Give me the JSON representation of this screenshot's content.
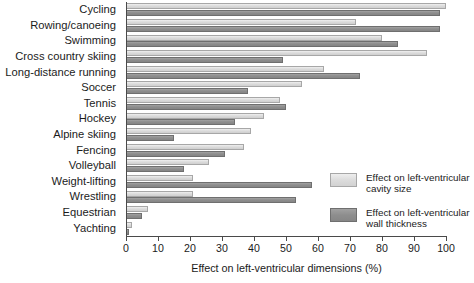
{
  "chart_data": {
    "type": "bar",
    "orientation": "horizontal",
    "title": "",
    "xlabel": "Effect on left-ventricular dimensions (%)",
    "ylabel": "",
    "xlim": [
      0,
      100
    ],
    "xticks": [
      0,
      10,
      20,
      30,
      40,
      50,
      60,
      70,
      80,
      90,
      100
    ],
    "xtick_labels": [
      "0",
      "10",
      "20",
      "30",
      "40",
      "50",
      "60",
      "70",
      "80",
      "90",
      "100"
    ],
    "grid": false,
    "legend_position": "right-lower",
    "categories": [
      "Cycling",
      "Rowing/canoeing",
      "Swimming",
      "Cross country skiing",
      "Long-distance running",
      "Soccer",
      "Tennis",
      "Hockey",
      "Alpine skiing",
      "Fencing",
      "Volleyball",
      "Weight-lifting",
      "Wrestling",
      "Equestrian",
      "Yachting"
    ],
    "series": [
      {
        "name": "Effect on left-ventricular cavity size",
        "color": "#dcdcdc",
        "values": [
          100,
          72,
          80,
          94,
          62,
          55,
          48,
          43,
          39,
          37,
          26,
          21,
          21,
          7,
          2
        ]
      },
      {
        "name": "Effect on left-ventricular wall thickness",
        "color": "#8e8e8e",
        "values": [
          98,
          98,
          85,
          49,
          73,
          38,
          50,
          34,
          15,
          31,
          18,
          58,
          53,
          5,
          1
        ]
      }
    ]
  },
  "legend": {
    "items": [
      {
        "swatch": "light",
        "line1": "Effect on left-ventricular",
        "line2": "cavity size"
      },
      {
        "swatch": "dark",
        "line1": "Effect on left-ventricular",
        "line2": "wall thickness"
      }
    ]
  }
}
